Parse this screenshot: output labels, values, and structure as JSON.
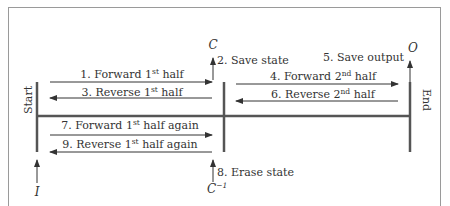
{
  "diagram": {
    "start_label": "Start",
    "end_label": "End",
    "nodes": {
      "I": "I",
      "C": "C",
      "C_inv": "C",
      "C_inv_sup": "−1",
      "O": "O"
    },
    "steps": [
      {
        "pre": "1. Forward 1",
        "sup": "st",
        "post": " half",
        "direction": "right"
      },
      {
        "text": "2. Save state"
      },
      {
        "pre": "3. Reverse 1",
        "sup": "st",
        "post": " half",
        "direction": "left"
      },
      {
        "pre": "4. Forward 2",
        "sup": "nd",
        "post": " half",
        "direction": "right"
      },
      {
        "text": "5. Save output"
      },
      {
        "pre": "6. Reverse 2",
        "sup": "nd",
        "post": " half",
        "direction": "left"
      },
      {
        "pre": "7. Forward 1",
        "sup": "st",
        "post": " half again",
        "direction": "right"
      },
      {
        "text": "8. Erase state"
      },
      {
        "pre": "9. Reverse 1",
        "sup": "st",
        "post": " half again",
        "direction": "left"
      }
    ],
    "colors": {
      "line": "#555555",
      "text": "#333333",
      "frame": "#9a9a9a"
    }
  }
}
